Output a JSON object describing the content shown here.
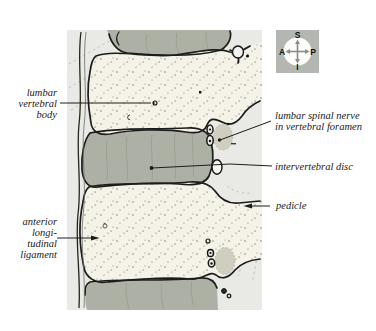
{
  "figure": {
    "background": "#ffffff",
    "panel_bg": "#e9eae5",
    "bone_color": "#f5f3e8",
    "disc_color": "#adb0a5",
    "nerve_color": "#cfcec0",
    "outline_color": "#1c1c1c",
    "compass_bg": "#b4b7b1"
  },
  "compass": {
    "top": "S",
    "right": "P",
    "bottom": "I",
    "left": "A"
  },
  "labels": {
    "lumbar_vertebral_body": {
      "lines": [
        "lumbar",
        "vertebral",
        "body"
      ]
    },
    "lumbar_spinal_nerve": {
      "lines": [
        "lumbar spinal nerve",
        "in vertebral foramen"
      ]
    },
    "intervertebral_disc": {
      "lines": [
        "intervertebral disc"
      ]
    },
    "pedicle": {
      "lines": [
        "pedicle"
      ]
    },
    "anterior_longitudinal_ligament": {
      "lines": [
        "anterior",
        "longi-",
        "tudinal",
        "ligament"
      ]
    }
  }
}
